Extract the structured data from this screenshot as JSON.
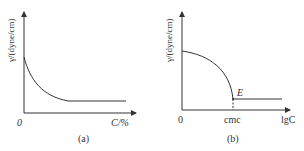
{
  "panels": [
    {
      "id": "a",
      "caption": "(a)",
      "y_axis_label": "γ/(dyne/cm)",
      "x_axis_label": "C/%",
      "origin_label": "0",
      "curve": "exponential decay, then constant plateau"
    },
    {
      "id": "b",
      "caption": "(b)",
      "y_axis_label": "γ/(dyne/cm)",
      "x_axis_label": "lgC",
      "origin_label": "0",
      "tick_label": "cmc",
      "point_label": "E",
      "curve": "concave-down drop to cmc, then constant plateau"
    }
  ],
  "colors": {
    "line": "#333333",
    "background": "#ffffff"
  }
}
